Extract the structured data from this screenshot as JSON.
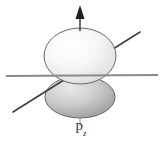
{
  "figure": {
    "label": {
      "base": "p",
      "subscript": "z"
    },
    "colors": {
      "background": "#ffffff",
      "upper_lobe_fill_light": "#fdfdfd",
      "upper_lobe_fill_dark": "#dddddd",
      "lower_lobe_fill_light": "#e2e2e2",
      "lower_lobe_fill_dark": "#9a9a9a",
      "outline": "#5a5a5a",
      "axis_line": "#8a8a8a",
      "diagonal_line": "#3f3f3f",
      "arrow": "#1f1f1f",
      "label_text": "#3a3a3a",
      "leader_line": "#9a9a9a"
    },
    "elements": {
      "upper_lobe": {
        "name": "upper-lobe",
        "cx": 80,
        "cy": 56,
        "rx": 36,
        "ry": 28
      },
      "lower_lobe": {
        "name": "lower-lobe",
        "cx": 80,
        "cy": 97,
        "rx": 35,
        "ry": 21
      },
      "vertical_axis_arrow": {
        "name": "z-axis-arrow",
        "x": 80,
        "y_top": 6,
        "y_bottom": 30,
        "direction": "up"
      },
      "horizontal_axis": {
        "name": "horizontal-axis",
        "x1": 6,
        "y1": 76,
        "x2": 158,
        "y2": 75
      },
      "diagonal_axis": {
        "name": "diagonal-axis",
        "x1": 13,
        "y1": 112,
        "x2": 140,
        "y2": 32
      },
      "leader_line": {
        "name": "label-leader-line",
        "x": 80,
        "y_top": 116,
        "y_bottom": 126
      }
    }
  }
}
